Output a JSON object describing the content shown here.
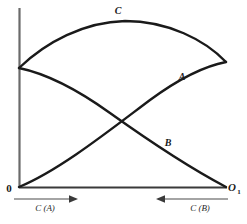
{
  "figure": {
    "background_color": "#ffffff",
    "ink_color": "#1a1a1a",
    "axis_color": "#555555"
  },
  "axes": {
    "y_axis_name": "vertical-axis",
    "x_axis_name": "horizontal-axis",
    "origin_label": "0",
    "right_origin_label": "O",
    "right_origin_subscript": "1"
  },
  "captions": {
    "left": {
      "text": "C (A)",
      "arrow": "arrow-right",
      "direction": "right"
    },
    "right": {
      "text": "C (B)",
      "arrow": "arrow-left",
      "direction": "left"
    }
  },
  "chart_data": {
    "type": "line",
    "title": "",
    "xlabel": "",
    "ylabel": "",
    "grid": false,
    "legend": "inline-curve-labels",
    "xlim": [
      0,
      100
    ],
    "ylim": [
      0,
      100
    ],
    "axis_pixels": {
      "x_left": 19,
      "x_right": 226,
      "y_top": 8,
      "y_bottom": 187
    },
    "annotations": [
      {
        "label": "C",
        "x": 118,
        "y": 10,
        "style": "italic-bold"
      },
      {
        "label": "A",
        "x": 182,
        "y": 76,
        "style": "italic-bold"
      },
      {
        "label": "B",
        "x": 168,
        "y": 142,
        "style": "italic-bold"
      }
    ],
    "intersections": [
      {
        "curves": [
          "A",
          "B"
        ],
        "x_px": 104,
        "y_px": 105
      }
    ],
    "series": [
      {
        "name": "A",
        "label": "A",
        "description": "rises concavely from origin to right plateau",
        "start_px": [
          19,
          187
        ],
        "end_px": [
          226,
          62
        ],
        "path": "M 19 187 C 60 170, 110 130, 150 100 C 180 78, 205 66, 226 62",
        "points_px": [
          [
            19,
            187
          ],
          [
            45,
            172
          ],
          [
            70,
            155
          ],
          [
            95,
            136
          ],
          [
            120,
            119
          ],
          [
            145,
            103
          ],
          [
            170,
            88
          ],
          [
            195,
            74
          ],
          [
            226,
            62
          ]
        ]
      },
      {
        "name": "B",
        "label": "B",
        "description": "descends from y-axis start point down to right origin O1",
        "start_px": [
          19,
          68
        ],
        "end_px": [
          226,
          187
        ],
        "path": "M 19 68 C 48 74, 78 90, 110 113 C 145 138, 190 168, 226 187",
        "points_px": [
          [
            19,
            68
          ],
          [
            45,
            73
          ],
          [
            70,
            85
          ],
          [
            95,
            101
          ],
          [
            120,
            119
          ],
          [
            145,
            137
          ],
          [
            170,
            155
          ],
          [
            198,
            172
          ],
          [
            226,
            187
          ]
        ]
      },
      {
        "name": "C",
        "label": "C",
        "description": "arc peaking near upper middle, from y-axis start to right plateau",
        "start_px": [
          19,
          68
        ],
        "end_px": [
          226,
          62
        ],
        "peak_px": [
          125,
          21
        ],
        "path": "M 19 68 C 46 42, 84 22, 125 21 C 168 21, 205 40, 226 62",
        "points_px": [
          [
            19,
            68
          ],
          [
            45,
            46
          ],
          [
            70,
            33
          ],
          [
            95,
            25
          ],
          [
            125,
            21
          ],
          [
            150,
            22
          ],
          [
            175,
            30
          ],
          [
            200,
            44
          ],
          [
            226,
            62
          ]
        ]
      }
    ]
  }
}
